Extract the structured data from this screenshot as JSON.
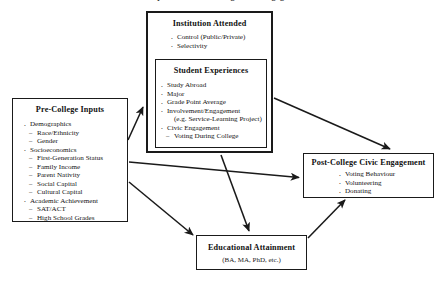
{
  "page": {
    "clipped_title": "Conceptual Model of College Civic Engagement"
  },
  "diagram": {
    "type": "flow-diagram",
    "boxes": {
      "precollege": {
        "title": "Pre-College Inputs",
        "items": [
          {
            "level": 1,
            "text": "Demographics"
          },
          {
            "level": 2,
            "text": "Race/Ethnicity"
          },
          {
            "level": 2,
            "text": "Gender"
          },
          {
            "level": 1,
            "text": "Socioeconomics"
          },
          {
            "level": 2,
            "text": "First-Generation Status"
          },
          {
            "level": 2,
            "text": "Family Income"
          },
          {
            "level": 2,
            "text": "Parent Nativity"
          },
          {
            "level": 2,
            "text": "Social Capital"
          },
          {
            "level": 2,
            "text": "Cultural Capital"
          },
          {
            "level": 1,
            "text": "Academic Achievement"
          },
          {
            "level": 2,
            "text": "SAT/ACT"
          },
          {
            "level": 2,
            "text": "High School Grades"
          }
        ]
      },
      "institution": {
        "title": "Institution Attended",
        "items": [
          {
            "level": 1,
            "text": "Control (Public/Private)"
          },
          {
            "level": 1,
            "text": "Selectivity"
          }
        ]
      },
      "student_experiences": {
        "title": "Student Experiences",
        "items": [
          {
            "level": 1,
            "text": "Study Abroad"
          },
          {
            "level": 1,
            "text": "Major"
          },
          {
            "level": 1,
            "text": "Grade Point Average"
          },
          {
            "level": 1,
            "text": "Involvement/Engagement"
          },
          {
            "level": 0,
            "text": "(e.g. Service-Learning Project)"
          },
          {
            "level": 1,
            "text": "Civic Engagement"
          },
          {
            "level": 2,
            "text": "Voting During College"
          }
        ]
      },
      "postcollege": {
        "title": "Post-College Civic Engagement",
        "items": [
          {
            "level": 1,
            "text": "Voting Behaviour"
          },
          {
            "level": 1,
            "text": "Volunteering"
          },
          {
            "level": 1,
            "text": "Donating"
          }
        ]
      },
      "educational_attainment": {
        "title": "Educational Attainment",
        "subtitle": "(BA, MA, PhD, etc.)"
      }
    },
    "arrows": [
      {
        "name": "precollege-to-institution",
        "from": "precollege",
        "to": "institution",
        "x1": 128,
        "y1": 140,
        "x2": 144,
        "y2": 106
      },
      {
        "name": "precollege-to-postcollege",
        "from": "precollege",
        "to": "postcollege",
        "x1": 129,
        "y1": 162,
        "x2": 300,
        "y2": 178
      },
      {
        "name": "precollege-to-educational-attainment",
        "from": "precollege",
        "to": "educational_attainment",
        "x1": 129,
        "y1": 183,
        "x2": 194,
        "y2": 236
      },
      {
        "name": "institution-to-postcollege",
        "from": "institution",
        "to": "postcollege",
        "x1": 274,
        "y1": 98,
        "x2": 391,
        "y2": 150
      },
      {
        "name": "institution-to-educational-attainment",
        "from": "institution",
        "to": "educational_attainment",
        "x1": 222,
        "y1": 155,
        "x2": 250,
        "y2": 232
      },
      {
        "name": "educational-attainment-to-postcollege",
        "from": "educational_attainment",
        "to": "postcollege",
        "x1": 308,
        "y1": 238,
        "x2": 345,
        "y2": 201
      }
    ],
    "colors": {
      "stroke": "#1a1a1a",
      "background": "#ffffff",
      "text": "#141414"
    }
  }
}
